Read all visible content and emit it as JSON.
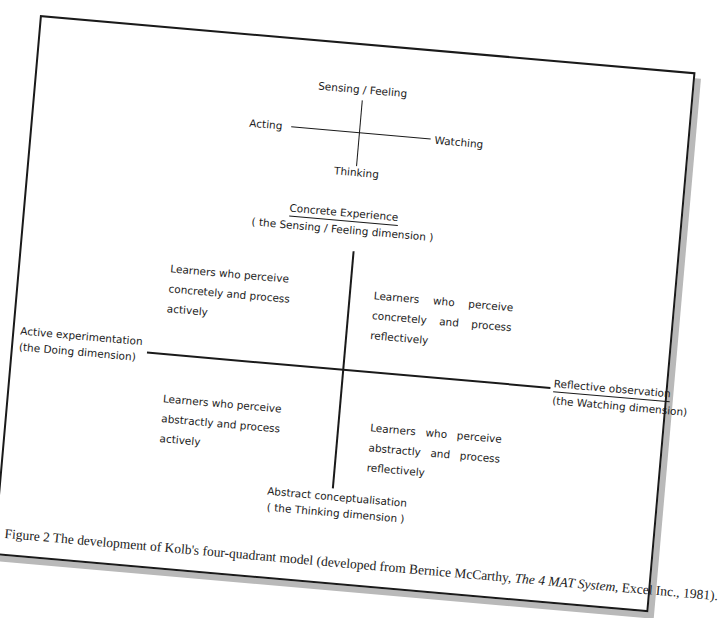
{
  "small_diagram": {
    "top": "Sensing / Feeling",
    "left": "Acting",
    "right": "Watching",
    "bottom": "Thinking"
  },
  "main_diagram": {
    "top": {
      "title": "Concrete Experience",
      "subtitle": "( the Sensing / Feeling dimension )"
    },
    "left": {
      "title": "Active experimentation",
      "subtitle": "(the Doing dimension)"
    },
    "right": {
      "title": "Reflective observation",
      "subtitle": "(the Watching dimension)"
    },
    "bottom": {
      "title": "Abstract conceptualisation",
      "subtitle": "( the Thinking dimension )"
    },
    "quadrants": {
      "top_left": [
        "Learners who perceive",
        "concretely and process",
        "actively"
      ],
      "top_right": [
        "Learners who perceive",
        "concretely and process",
        "reflectively"
      ],
      "bottom_left": [
        "Learners who perceive",
        "abstractly and process",
        "actively"
      ],
      "bottom_right": [
        "Learners who perceive",
        "abstractly and process",
        "reflectively"
      ]
    }
  },
  "caption": {
    "prefix": "Figure 2 The development of Kolb's four-quadrant model (developed from Bernice McCarthy, ",
    "book_title": "The 4 MAT System",
    "suffix": ", Excel Inc., 1981)."
  }
}
